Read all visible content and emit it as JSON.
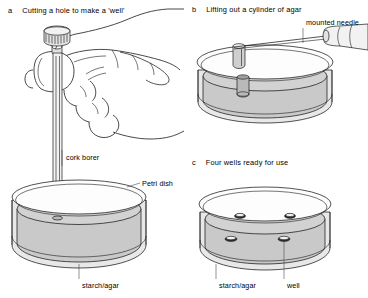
{
  "figure": {
    "background_color": "#ffffff",
    "line_color": "#1a1a1a",
    "agar_fill_color": "#d2d2d2"
  },
  "panels": [
    {
      "key": "a",
      "letter": "a",
      "heading": "Cutting a hole to make a 'well'",
      "labels": [
        {
          "key": "cork_borer",
          "text": "cork borer"
        },
        {
          "key": "petri_dish",
          "text": "Petri dish"
        },
        {
          "key": "starch_agar",
          "text": "starch/agar"
        }
      ],
      "objects": [
        "hand",
        "cork-borer",
        "petri-dish",
        "starch-agar"
      ]
    },
    {
      "key": "b",
      "letter": "b",
      "heading": "Lifting out a cylinder of agar",
      "labels": [
        {
          "key": "mounted_needle",
          "text": "mounted needle"
        }
      ],
      "objects": [
        "mounted-needle",
        "agar-cylinder",
        "well-hole",
        "petri-dish",
        "starch-agar"
      ]
    },
    {
      "key": "c",
      "letter": "c",
      "heading": "Four wells ready for use",
      "labels": [
        {
          "key": "starch_agar",
          "text": "starch/agar"
        },
        {
          "key": "well",
          "text": "well"
        }
      ],
      "well_count": 4,
      "objects": [
        "petri-dish",
        "starch-agar",
        "well",
        "well",
        "well",
        "well"
      ]
    }
  ]
}
